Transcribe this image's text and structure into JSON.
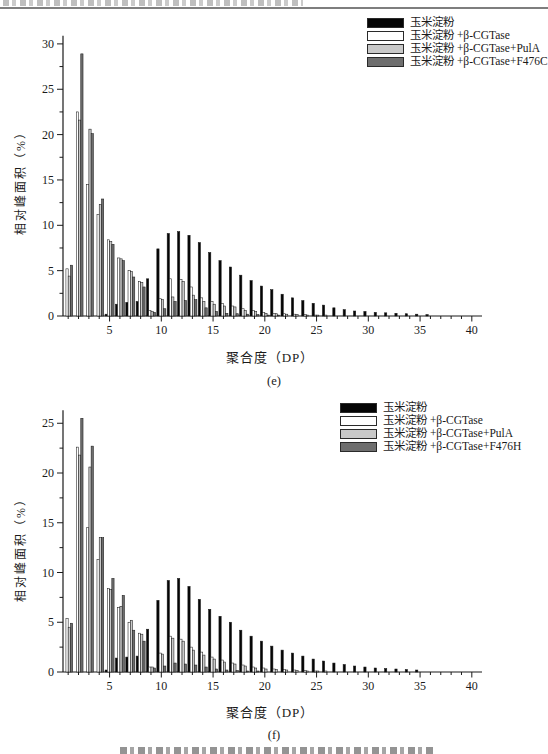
{
  "chart_data": [
    {
      "type": "bar",
      "caption": "(e)",
      "xlabel": "聚合度（DP）",
      "ylabel": "相对峰面积（%）",
      "x_range": [
        1,
        40
      ],
      "x_tick_labels": [
        5,
        10,
        15,
        20,
        25,
        30,
        35,
        40
      ],
      "ylim": [
        0,
        30
      ],
      "y_major": 5,
      "y_minor": 2.5,
      "grid": false,
      "legend_position": "top-right",
      "series": [
        {
          "name": "玉米淀粉",
          "color": "#050505",
          "values": [
            0,
            0,
            0,
            0,
            0.2,
            1.3,
            1.5,
            1.6,
            4.1,
            7.4,
            9.1,
            9.3,
            8.9,
            8.1,
            7.0,
            6.1,
            5.4,
            4.5,
            3.9,
            3.3,
            2.9,
            2.4,
            2.0,
            1.7,
            1.4,
            1.2,
            0.9,
            0.7,
            0.55,
            0.5,
            0.4,
            0.35,
            0.3,
            0.25,
            0.2,
            0.15,
            0,
            0,
            0,
            0
          ]
        },
        {
          "name": "玉米淀粉 +β-CGTase",
          "color": "#ffffff",
          "values": [
            5.2,
            22.5,
            14.5,
            11.2,
            8.4,
            6.4,
            5.0,
            3.8,
            0.6,
            1.9,
            4.1,
            4.0,
            3.2,
            2.0,
            1.6,
            1.4,
            1.1,
            0.8,
            0.6,
            0.4,
            0.3,
            0.25,
            0.2,
            0.15,
            0.1,
            0.1,
            0,
            0,
            0,
            0,
            0,
            0,
            0,
            0,
            0,
            0,
            0,
            0,
            0,
            0
          ]
        },
        {
          "name": "玉米淀粉 +β-CGTase+PulA",
          "color": "#c9c9c9",
          "values": [
            4.4,
            21.6,
            20.6,
            12.3,
            8.2,
            6.3,
            4.9,
            3.7,
            0.5,
            1.8,
            2.1,
            3.8,
            2.3,
            1.6,
            1.3,
            1.1,
            1.0,
            0.6,
            0.5,
            0.3,
            0.25,
            0.2,
            0.15,
            0.1,
            0.1,
            0,
            0,
            0,
            0,
            0,
            0,
            0,
            0,
            0,
            0,
            0,
            0,
            0,
            0,
            0
          ]
        },
        {
          "name": "玉米淀粉 +β-CGTase+F476C",
          "color": "#6e6e6e",
          "values": [
            5.6,
            28.9,
            20.1,
            12.9,
            7.9,
            6.1,
            4.3,
            3.2,
            0.4,
            0.8,
            1.6,
            1.7,
            1.8,
            0.9,
            0.5,
            0.3,
            0.25,
            0.2,
            0.15,
            0.1,
            0.1,
            0,
            0,
            0,
            0,
            0,
            0,
            0,
            0,
            0,
            0,
            0,
            0,
            0,
            0,
            0,
            0,
            0,
            0,
            0
          ]
        }
      ]
    },
    {
      "type": "bar",
      "caption": "(f)",
      "xlabel": "聚合度（DP）",
      "ylabel": "相对峰面积（%）",
      "x_range": [
        1,
        40
      ],
      "x_tick_labels": [
        5,
        10,
        15,
        20,
        25,
        30,
        35,
        40
      ],
      "ylim": [
        0,
        25
      ],
      "y_major": 5,
      "y_minor": 2.5,
      "grid": false,
      "legend_position": "top-right",
      "series": [
        {
          "name": "玉米淀粉",
          "color": "#050505",
          "values": [
            0,
            0,
            0,
            0,
            0.2,
            1.4,
            1.5,
            1.6,
            4.3,
            7.2,
            9.2,
            9.4,
            8.6,
            7.3,
            6.3,
            5.6,
            5.0,
            4.2,
            3.6,
            3.1,
            2.6,
            2.2,
            1.9,
            1.6,
            1.3,
            1.1,
            0.9,
            0.75,
            0.6,
            0.5,
            0.4,
            0.35,
            0.3,
            0.25,
            0.2,
            0,
            0,
            0,
            0,
            0
          ]
        },
        {
          "name": "玉米淀粉 +β-CGTase",
          "color": "#ffffff",
          "values": [
            5.4,
            22.6,
            14.5,
            11.3,
            8.4,
            6.5,
            5.0,
            3.9,
            0.5,
            1.9,
            3.6,
            3.3,
            2.5,
            2.0,
            1.5,
            1.2,
            0.9,
            0.7,
            0.5,
            0.4,
            0.3,
            0.25,
            0.2,
            0.15,
            0.1,
            0.1,
            0,
            0,
            0,
            0,
            0,
            0,
            0,
            0,
            0,
            0,
            0,
            0,
            0,
            0
          ]
        },
        {
          "name": "玉米淀粉 +β-CGTase+PulA",
          "color": "#c9c9c9",
          "values": [
            4.5,
            21.8,
            20.6,
            13.5,
            8.3,
            6.6,
            5.2,
            3.8,
            0.5,
            1.8,
            3.4,
            3.1,
            2.2,
            1.7,
            1.3,
            1.0,
            0.8,
            0.6,
            0.4,
            0.3,
            0.25,
            0.2,
            0.15,
            0.1,
            0.1,
            0,
            0,
            0,
            0,
            0,
            0,
            0,
            0,
            0,
            0,
            0,
            0,
            0,
            0,
            0
          ]
        },
        {
          "name": "玉米淀粉 +β-CGTase+F476H",
          "color": "#6e6e6e",
          "values": [
            4.9,
            25.5,
            22.7,
            13.5,
            9.4,
            7.7,
            4.2,
            3.1,
            0.4,
            0.6,
            0.9,
            0.8,
            0.7,
            0.5,
            0.3,
            0.2,
            0.15,
            0.1,
            0.1,
            0,
            0,
            0,
            0,
            0,
            0,
            0,
            0,
            0,
            0,
            0,
            0,
            0,
            0,
            0,
            0,
            0,
            0,
            0,
            0,
            0
          ]
        }
      ]
    }
  ]
}
